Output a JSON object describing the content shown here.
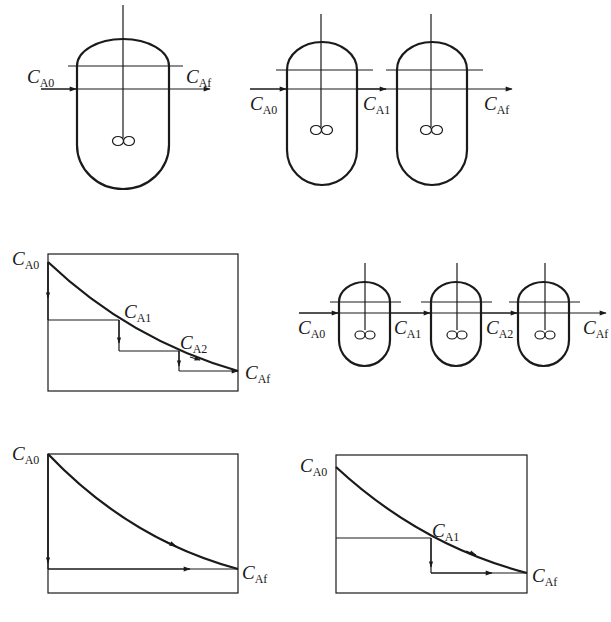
{
  "figure": {
    "colors": {
      "stroke": "#1a1a1a",
      "background": "#ffffff"
    }
  },
  "panels": {
    "single_reactor": {
      "inlet": {
        "symbol": "C",
        "sub": "A0"
      },
      "outlet": {
        "symbol": "C",
        "sub": "Af"
      }
    },
    "two_reactors": {
      "inlet": {
        "symbol": "C",
        "sub": "A0"
      },
      "intermediate": {
        "symbol": "C",
        "sub": "A1"
      },
      "outlet": {
        "symbol": "C",
        "sub": "Af"
      }
    },
    "three_reactors": {
      "inlet": {
        "symbol": "C",
        "sub": "A0"
      },
      "intermediate1": {
        "symbol": "C",
        "sub": "A1"
      },
      "intermediate2": {
        "symbol": "C",
        "sub": "A2"
      },
      "outlet": {
        "symbol": "C",
        "sub": "Af"
      }
    },
    "plot_three_stage": {
      "start": {
        "symbol": "C",
        "sub": "A0"
      },
      "step1": {
        "symbol": "C",
        "sub": "A1"
      },
      "step2": {
        "symbol": "C",
        "sub": "A2"
      },
      "end": {
        "symbol": "C",
        "sub": "Af"
      }
    },
    "plot_single_stage": {
      "start": {
        "symbol": "C",
        "sub": "A0"
      },
      "end": {
        "symbol": "C",
        "sub": "Af"
      }
    },
    "plot_two_stage": {
      "start": {
        "symbol": "C",
        "sub": "A0"
      },
      "step1": {
        "symbol": "C",
        "sub": "A1"
      },
      "end": {
        "symbol": "C",
        "sub": "Af"
      }
    }
  }
}
